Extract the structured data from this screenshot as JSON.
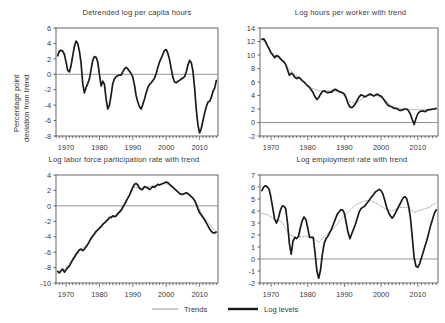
{
  "figure": {
    "background": "#ffffff",
    "line_color": "#1a1a1a",
    "trend_color": "#9a9a9a",
    "axis_color": "#555555",
    "zero_line_color": "#888888"
  },
  "legend": {
    "trends_label": "Trends",
    "log_levels_label": "Log levels"
  },
  "chart_data": [
    {
      "type": "line",
      "panel": "top-left",
      "title": "Detrended log per capita hours",
      "xlabel": "",
      "ylabel": "Percentage point deviation from trend",
      "ylabel_line1": "Percentage point",
      "ylabel_line2": "deviation from trend",
      "xlim": [
        1967,
        2015.5
      ],
      "ylim": [
        -8,
        6
      ],
      "yticks": [
        6,
        4,
        2,
        0,
        -2,
        -4,
        -6,
        -8
      ],
      "xticks": [
        1970,
        1980,
        1990,
        2000,
        2010
      ],
      "grid": false,
      "legend_position": "figure-bottom",
      "series": [
        {
          "name": "Log levels",
          "style": "thick-black",
          "x": [
            1967.5,
            1968,
            1968.5,
            1969,
            1969.5,
            1970,
            1970.5,
            1971,
            1971.5,
            1972,
            1972.5,
            1973,
            1973.5,
            1974,
            1974.5,
            1975,
            1975.5,
            1976,
            1976.5,
            1977,
            1977.5,
            1978,
            1978.5,
            1979,
            1979.5,
            1980,
            1980.5,
            1981,
            1981.5,
            1982,
            1982.5,
            1983,
            1983.5,
            1984,
            1984.5,
            1985,
            1985.5,
            1986,
            1986.5,
            1987,
            1987.5,
            1988,
            1988.5,
            1989,
            1989.5,
            1990,
            1990.5,
            1991,
            1991.5,
            1992,
            1992.5,
            1993,
            1993.5,
            1994,
            1994.5,
            1995,
            1995.5,
            1996,
            1996.5,
            1997,
            1997.5,
            1998,
            1998.5,
            1999,
            1999.5,
            2000,
            2000.5,
            2001,
            2001.5,
            2002,
            2002.5,
            2003,
            2003.5,
            2004,
            2004.5,
            2005,
            2005.5,
            2006,
            2006.5,
            2007,
            2007.5,
            2008,
            2008.5,
            2009,
            2009.5,
            2010,
            2010.5,
            2011,
            2011.5,
            2012,
            2012.5,
            2013,
            2013.5,
            2014,
            2014.5,
            2015
          ],
          "values": [
            2.4,
            3.0,
            3.1,
            3.0,
            2.6,
            1.6,
            0.5,
            0.3,
            1.1,
            2.4,
            3.6,
            4.3,
            4.0,
            3.0,
            1.5,
            -1.2,
            -2.4,
            -1.7,
            -1.2,
            -0.6,
            0.6,
            1.8,
            2.3,
            2.2,
            1.6,
            0.0,
            -1.5,
            -0.9,
            -1.3,
            -3.2,
            -4.5,
            -4.0,
            -2.7,
            -1.2,
            -0.6,
            -0.3,
            -0.2,
            -0.1,
            -0.1,
            0.3,
            0.7,
            0.9,
            0.7,
            0.4,
            0.1,
            -0.4,
            -1.4,
            -2.8,
            -3.6,
            -4.2,
            -4.5,
            -3.9,
            -3.2,
            -2.4,
            -1.7,
            -1.3,
            -1.1,
            -0.8,
            -0.5,
            0.1,
            0.9,
            1.6,
            2.1,
            2.6,
            3.1,
            3.2,
            2.7,
            1.9,
            0.7,
            -0.4,
            -1.0,
            -1.1,
            -0.9,
            -0.8,
            -0.6,
            -0.5,
            -0.3,
            0.3,
            1.2,
            1.8,
            1.5,
            0.4,
            -1.8,
            -4.6,
            -6.6,
            -7.6,
            -7.0,
            -6.0,
            -5.0,
            -4.2,
            -3.6,
            -3.5,
            -3.0,
            -2.2,
            -1.8,
            -0.8
          ]
        }
      ]
    },
    {
      "type": "line",
      "panel": "top-right",
      "title": "Log hours per worker with trend",
      "xlabel": "",
      "ylabel": "",
      "xlim": [
        1967,
        2015.5
      ],
      "ylim": [
        -2,
        14
      ],
      "yticks": [
        14,
        12,
        10,
        8,
        6,
        4,
        2,
        0,
        -2
      ],
      "xticks": [
        1970,
        1980,
        1990,
        2000,
        2010
      ],
      "grid": false,
      "series": [
        {
          "name": "Log levels",
          "style": "thick-black",
          "x": [
            1967.5,
            1968,
            1968.5,
            1969,
            1969.5,
            1970,
            1970.5,
            1971,
            1971.5,
            1972,
            1972.5,
            1973,
            1973.5,
            1974,
            1974.5,
            1975,
            1975.5,
            1976,
            1976.5,
            1977,
            1977.5,
            1978,
            1978.5,
            1979,
            1979.5,
            1980,
            1980.5,
            1981,
            1981.5,
            1982,
            1982.5,
            1983,
            1983.5,
            1984,
            1984.5,
            1985,
            1985.5,
            1986,
            1986.5,
            1987,
            1987.5,
            1988,
            1988.5,
            1989,
            1989.5,
            1990,
            1990.5,
            1991,
            1991.5,
            1992,
            1992.5,
            1993,
            1993.5,
            1994,
            1994.5,
            1995,
            1995.5,
            1996,
            1996.5,
            1997,
            1997.5,
            1998,
            1998.5,
            1999,
            1999.5,
            2000,
            2000.5,
            2001,
            2001.5,
            2002,
            2002.5,
            2003,
            2003.5,
            2004,
            2004.5,
            2005,
            2005.5,
            2006,
            2006.5,
            2007,
            2007.5,
            2008,
            2008.5,
            2009,
            2009.5,
            2010,
            2010.5,
            2011,
            2011.5,
            2012,
            2012.5,
            2013,
            2013.5,
            2014,
            2014.5,
            2015
          ],
          "values": [
            12.3,
            12.4,
            12.0,
            11.4,
            10.9,
            10.3,
            10.0,
            9.6,
            9.9,
            9.8,
            9.5,
            9.2,
            9.0,
            8.6,
            7.8,
            7.0,
            7.3,
            7.1,
            6.7,
            6.5,
            6.7,
            6.5,
            6.2,
            6.0,
            5.7,
            5.4,
            5.2,
            4.8,
            4.4,
            3.8,
            3.4,
            3.7,
            4.2,
            4.6,
            4.7,
            4.5,
            4.4,
            4.5,
            4.5,
            4.8,
            4.9,
            4.8,
            4.6,
            4.5,
            4.4,
            4.2,
            3.6,
            2.8,
            2.3,
            2.2,
            2.4,
            2.8,
            3.3,
            3.8,
            4.1,
            4.0,
            3.8,
            3.9,
            4.1,
            4.2,
            4.1,
            3.9,
            4.1,
            4.2,
            4.0,
            3.9,
            3.6,
            3.2,
            2.8,
            2.5,
            2.4,
            2.3,
            2.1,
            2.1,
            2.0,
            1.8,
            1.8,
            1.9,
            2.0,
            2.0,
            1.7,
            1.2,
            0.4,
            -0.3,
            0.6,
            1.3,
            1.6,
            1.7,
            1.7,
            1.6,
            1.8,
            1.9,
            1.9,
            2.0,
            2.0,
            2.1
          ]
        },
        {
          "name": "Trends",
          "style": "thin-gray-dotted",
          "x": [
            1967.5,
            1970,
            1973,
            1976,
            1979,
            1981,
            1983,
            1986,
            1989,
            1991,
            1993,
            1996,
            1999,
            2001,
            2003,
            2006,
            2009,
            2011,
            2013,
            2015
          ],
          "values": [
            12.5,
            10.5,
            9.2,
            7.3,
            6.0,
            5.1,
            4.7,
            4.7,
            4.6,
            3.2,
            2.8,
            4.0,
            4.0,
            3.4,
            2.3,
            2.0,
            1.9,
            1.9,
            1.9,
            2.0
          ]
        }
      ]
    },
    {
      "type": "line",
      "panel": "bottom-left",
      "title": "Log labor force participation rate with trend",
      "xlabel": "",
      "ylabel": "",
      "xlim": [
        1967,
        2015.5
      ],
      "ylim": [
        -10,
        4
      ],
      "yticks": [
        4,
        2,
        0,
        -2,
        -4,
        -6,
        -8,
        -10
      ],
      "xticks": [
        1970,
        1980,
        1990,
        2000,
        2010
      ],
      "grid": false,
      "series": [
        {
          "name": "Log levels",
          "style": "thick-black",
          "x": [
            1967.5,
            1968,
            1968.5,
            1969,
            1969.5,
            1970,
            1970.5,
            1971,
            1971.5,
            1972,
            1972.5,
            1973,
            1973.5,
            1974,
            1974.5,
            1975,
            1975.5,
            1976,
            1976.5,
            1977,
            1977.5,
            1978,
            1978.5,
            1979,
            1979.5,
            1980,
            1980.5,
            1981,
            1981.5,
            1982,
            1982.5,
            1983,
            1983.5,
            1984,
            1984.5,
            1985,
            1985.5,
            1986,
            1986.5,
            1987,
            1987.5,
            1988,
            1988.5,
            1989,
            1989.5,
            1990,
            1990.5,
            1991,
            1991.5,
            1992,
            1992.5,
            1993,
            1993.5,
            1994,
            1994.5,
            1995,
            1995.5,
            1996,
            1996.5,
            1997,
            1997.5,
            1998,
            1998.5,
            1999,
            1999.5,
            2000,
            2000.5,
            2001,
            2001.5,
            2002,
            2002.5,
            2003,
            2003.5,
            2004,
            2004.5,
            2005,
            2005.5,
            2006,
            2006.5,
            2007,
            2007.5,
            2008,
            2008.5,
            2009,
            2009.5,
            2010,
            2010.5,
            2011,
            2011.5,
            2012,
            2012.5,
            2013,
            2013.5,
            2014,
            2014.5,
            2015
          ],
          "values": [
            -8.5,
            -8.7,
            -8.4,
            -8.2,
            -8.6,
            -8.3,
            -8.0,
            -7.8,
            -7.4,
            -7.0,
            -6.7,
            -6.3,
            -6.0,
            -5.7,
            -5.6,
            -5.8,
            -5.6,
            -5.3,
            -5.0,
            -4.6,
            -4.2,
            -3.9,
            -3.6,
            -3.3,
            -3.1,
            -2.9,
            -2.7,
            -2.4,
            -2.2,
            -2.0,
            -1.8,
            -1.5,
            -1.5,
            -1.3,
            -1.4,
            -1.3,
            -1.0,
            -0.8,
            -0.6,
            -0.2,
            0.2,
            0.6,
            1.0,
            1.4,
            1.9,
            2.4,
            2.8,
            2.9,
            2.7,
            2.3,
            2.1,
            2.2,
            2.5,
            2.4,
            2.3,
            2.1,
            2.3,
            2.5,
            2.4,
            2.6,
            2.8,
            2.7,
            2.8,
            2.9,
            3.0,
            3.1,
            3.0,
            2.8,
            2.6,
            2.4,
            2.2,
            2.0,
            1.8,
            1.6,
            1.5,
            1.5,
            1.6,
            1.7,
            1.6,
            1.4,
            1.2,
            1.0,
            0.7,
            0.2,
            -0.4,
            -0.9,
            -1.2,
            -1.5,
            -1.8,
            -2.2,
            -2.6,
            -3.0,
            -3.3,
            -3.5,
            -3.5,
            -3.4
          ]
        },
        {
          "name": "Trends",
          "style": "thin-gray-dotted",
          "x": [
            1967.5,
            1970,
            1973,
            1976,
            1979,
            1982,
            1985,
            1988,
            1990,
            1993,
            1996,
            1999,
            2001,
            2004,
            2007,
            2009,
            2011,
            2013,
            2015
          ],
          "values": [
            -8.7,
            -8.1,
            -6.1,
            -5.2,
            -3.5,
            -2.0,
            -1.2,
            0.6,
            2.4,
            2.3,
            2.6,
            2.9,
            2.8,
            1.6,
            1.5,
            0.3,
            -1.3,
            -2.4,
            -3.5
          ]
        }
      ]
    },
    {
      "type": "line",
      "panel": "bottom-right",
      "title": "Log employment rate with trend",
      "xlabel": "",
      "ylabel": "",
      "xlim": [
        1967,
        2015.5
      ],
      "ylim": [
        -2,
        7
      ],
      "yticks": [
        7,
        6,
        5,
        4,
        3,
        2,
        1,
        0,
        -1,
        -2
      ],
      "xticks": [
        1970,
        1980,
        1990,
        2000,
        2010
      ],
      "grid": false,
      "series": [
        {
          "name": "Log levels",
          "style": "thick-black",
          "x": [
            1967.5,
            1968,
            1968.5,
            1969,
            1969.5,
            1970,
            1970.5,
            1971,
            1971.5,
            1972,
            1972.5,
            1973,
            1973.5,
            1974,
            1974.5,
            1975,
            1975.5,
            1976,
            1976.5,
            1977,
            1977.5,
            1978,
            1978.5,
            1979,
            1979.5,
            1980,
            1980.5,
            1981,
            1981.5,
            1982,
            1982.5,
            1983,
            1983.5,
            1984,
            1984.5,
            1985,
            1985.5,
            1986,
            1986.5,
            1987,
            1987.5,
            1988,
            1988.5,
            1989,
            1989.5,
            1990,
            1990.5,
            1991,
            1991.5,
            1992,
            1992.5,
            1993,
            1993.5,
            1994,
            1994.5,
            1995,
            1995.5,
            1996,
            1996.5,
            1997,
            1997.5,
            1998,
            1998.5,
            1999,
            1999.5,
            2000,
            2000.5,
            2001,
            2001.5,
            2002,
            2002.5,
            2003,
            2003.5,
            2004,
            2004.5,
            2005,
            2005.5,
            2006,
            2006.5,
            2007,
            2007.5,
            2008,
            2008.5,
            2009,
            2009.5,
            2010,
            2010.5,
            2011,
            2011.5,
            2012,
            2012.5,
            2013,
            2013.5,
            2014,
            2014.5,
            2015
          ],
          "values": [
            5.7,
            6.0,
            6.1,
            6.0,
            5.8,
            5.1,
            4.2,
            3.3,
            3.0,
            3.4,
            4.0,
            4.4,
            4.4,
            4.2,
            3.0,
            1.3,
            0.4,
            1.5,
            1.8,
            1.7,
            1.9,
            2.6,
            3.2,
            3.5,
            3.3,
            2.6,
            1.8,
            1.8,
            1.8,
            0.5,
            -1.0,
            -1.6,
            -0.9,
            0.4,
            1.3,
            1.7,
            1.9,
            2.2,
            2.5,
            2.9,
            3.3,
            3.7,
            3.9,
            4.1,
            4.1,
            3.8,
            3.0,
            2.2,
            1.7,
            2.1,
            2.5,
            2.9,
            3.4,
            3.9,
            4.2,
            4.3,
            4.4,
            4.6,
            4.8,
            5.0,
            5.2,
            5.4,
            5.6,
            5.7,
            5.8,
            5.7,
            5.4,
            4.9,
            4.3,
            3.9,
            3.6,
            3.4,
            3.6,
            3.9,
            4.2,
            4.5,
            4.8,
            5.1,
            5.2,
            5.0,
            4.4,
            3.4,
            1.8,
            0.1,
            -0.6,
            -0.7,
            -0.4,
            0.1,
            0.6,
            1.1,
            1.6,
            2.2,
            2.8,
            3.3,
            3.8,
            4.1
          ]
        },
        {
          "name": "Trends",
          "style": "thin-gray-dotted",
          "x": [
            1967.5,
            1969,
            1971,
            1973,
            1975,
            1977,
            1979,
            1981,
            1983,
            1985,
            1987,
            1989,
            1991,
            1993,
            1995,
            1997,
            1999,
            2001,
            2003,
            2005,
            2007,
            2009,
            2011,
            2013,
            2015
          ],
          "values": [
            3.8,
            3.7,
            3.3,
            3.1,
            2.0,
            1.8,
            1.9,
            1.9,
            1.4,
            2.0,
            2.5,
            3.3,
            3.9,
            4.5,
            4.8,
            4.9,
            4.6,
            4.2,
            4.0,
            4.3,
            4.3,
            3.9,
            4.1,
            4.3,
            4.7
          ]
        }
      ]
    }
  ]
}
